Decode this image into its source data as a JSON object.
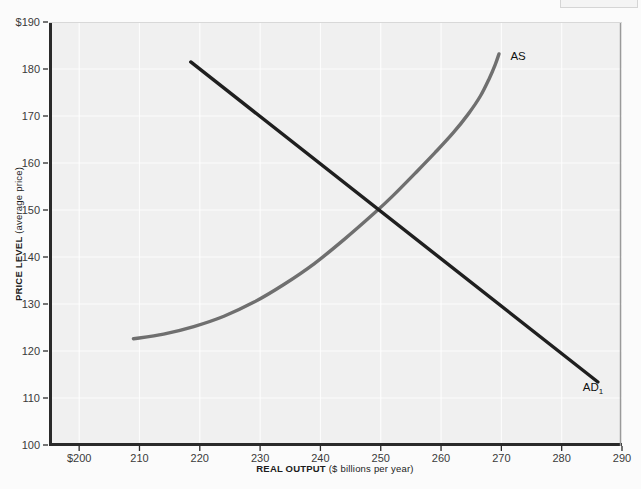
{
  "figure": {
    "background_color": "#f0f0f0",
    "page_color": "#fbfbfb"
  },
  "chart_data": {
    "type": "line",
    "title": "",
    "xlabel_bold": "REAL OUTPUT",
    "xlabel_rest": " ($ billions per year)",
    "ylabel_bold": "PRICE LEVEL",
    "ylabel_rest": " (average price)",
    "xlim": [
      195,
      290
    ],
    "ylim": [
      100,
      190
    ],
    "xticks": [
      200,
      210,
      220,
      230,
      240,
      250,
      260,
      270,
      280,
      290
    ],
    "xtick_labels": [
      "$200",
      "210",
      "220",
      "230",
      "240",
      "250",
      "260",
      "270",
      "280",
      "290"
    ],
    "yticks": [
      100,
      110,
      120,
      130,
      140,
      150,
      160,
      170,
      180,
      190
    ],
    "ytick_labels": [
      "100",
      "110",
      "120",
      "130",
      "140",
      "150",
      "160",
      "170",
      "180",
      "$190"
    ],
    "grid": true,
    "grid_color": "#ffffff",
    "legend": "none",
    "equilibrium": {
      "output": 250,
      "price_level": 150
    },
    "series": [
      {
        "name": "AS",
        "label": "AS",
        "label_sub": "",
        "color": "#6f6f6f",
        "width": 3.4,
        "shape": "upward-sloping-convex",
        "points": [
          [
            209.0,
            122.6
          ],
          [
            214.0,
            123.6
          ],
          [
            219.0,
            125.2
          ],
          [
            224.0,
            127.4
          ],
          [
            229.0,
            130.4
          ],
          [
            234.0,
            134.2
          ],
          [
            239.0,
            138.6
          ],
          [
            244.0,
            143.8
          ],
          [
            249.0,
            149.4
          ],
          [
            252.0,
            153.0
          ],
          [
            256.0,
            158.2
          ],
          [
            259.0,
            162.2
          ],
          [
            262.0,
            166.4
          ],
          [
            264.5,
            170.4
          ],
          [
            266.5,
            174.2
          ],
          [
            268.0,
            178.0
          ],
          [
            269.0,
            181.0
          ],
          [
            269.6,
            183.2
          ]
        ]
      },
      {
        "name": "AD1",
        "label": "AD",
        "label_sub": "1",
        "color": "#1f1f1f",
        "width": 3.4,
        "shape": "downward-sloping-linear",
        "points": [
          [
            218.5,
            181.5
          ],
          [
            286.0,
            113.4
          ]
        ]
      }
    ],
    "annotations": [
      {
        "text": "AS",
        "x": 271.5,
        "y": 182.0
      },
      {
        "text": "AD1",
        "x": 283.5,
        "y": 111.5
      }
    ]
  }
}
